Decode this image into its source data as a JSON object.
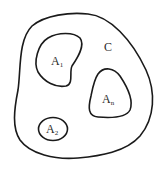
{
  "diagram": {
    "type": "set-region-diagram",
    "outer_region": {
      "label": "C"
    },
    "inner_regions": [
      {
        "label_main": "A",
        "label_sub": "1"
      },
      {
        "label_main": "A",
        "label_sub": "n"
      },
      {
        "label_main": "A",
        "label_sub": "2"
      }
    ],
    "colors": {
      "stroke": "#1a1a1a",
      "text": "#2a2a2a",
      "background": "#ffffff"
    }
  }
}
